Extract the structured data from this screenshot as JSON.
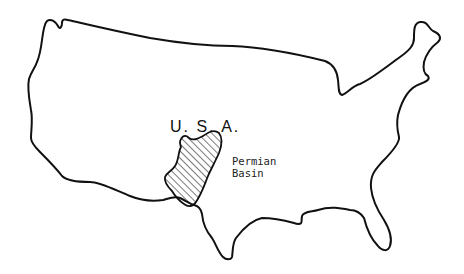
{
  "map": {
    "country_label": "U. S. A.",
    "region_label_line1": "Permian",
    "region_label_line2": "Basin",
    "outline_color": "#111111",
    "hatch_color": "#222222",
    "background": "#ffffff"
  }
}
